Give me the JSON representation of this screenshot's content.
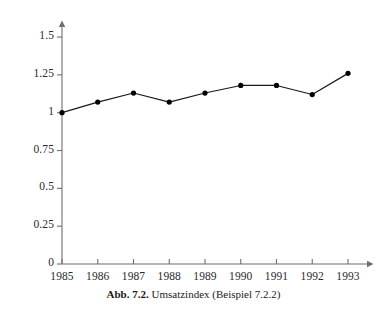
{
  "caption": {
    "label": "Abb. 7.2.",
    "text": "Umsatzindex (Beispiel 7.2.2)"
  },
  "colors": {
    "axis": "#6f6f6f",
    "line": "#1a1a1a",
    "marker": "#000000",
    "text": "#1a1a1a",
    "background": "#ffffff"
  },
  "chart_data": {
    "type": "line",
    "title": "",
    "xlabel": "",
    "ylabel": "",
    "categories": [
      "1985",
      "1986",
      "1987",
      "1988",
      "1989",
      "1990",
      "1991",
      "1992",
      "1993"
    ],
    "values": [
      1.0,
      1.07,
      1.13,
      1.07,
      1.13,
      1.18,
      1.18,
      1.12,
      1.26
    ],
    "series": [
      {
        "name": "Umsatzindex",
        "values": [
          1.0,
          1.07,
          1.13,
          1.07,
          1.13,
          1.18,
          1.18,
          1.12,
          1.26
        ]
      }
    ],
    "ylim": [
      0,
      1.6
    ],
    "ytick_labels": [
      "0",
      "0.25",
      "0.5",
      "0.75",
      "1",
      "1.25",
      "1.5"
    ],
    "ytick_values": [
      0,
      0.25,
      0.5,
      0.75,
      1,
      1.25,
      1.5
    ],
    "xtick_labels": [
      "1985",
      "1986",
      "1987",
      "1988",
      "1989",
      "1990",
      "1991",
      "1992",
      "1993"
    ],
    "grid": false,
    "legend": "none",
    "markers": "filled-circle",
    "axis_arrows": true
  }
}
